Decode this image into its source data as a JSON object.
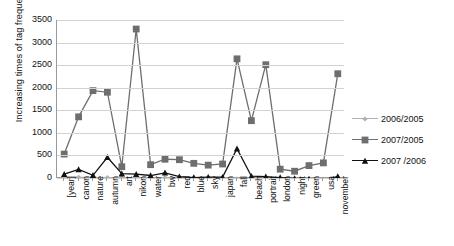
{
  "chart_data": {
    "type": "line",
    "title": "",
    "xlabel": "",
    "ylabel": "Increasing times of tag frequency",
    "ylim": [
      0,
      3500
    ],
    "ytick_labels": [
      "0",
      "500",
      "1000",
      "1500",
      "2000",
      "2500",
      "3000",
      "3500"
    ],
    "yticks": [
      0,
      500,
      1000,
      1500,
      2000,
      2500,
      3000,
      3500
    ],
    "grid": true,
    "legend_position": "right",
    "categories": [
      "[year]",
      "canon",
      "nature",
      "autumn",
      "art",
      "nikon",
      "water",
      "bw",
      "red",
      "blue",
      "sky",
      "japan",
      "fall",
      "beach",
      "portrait",
      "london",
      "night",
      "green",
      "usa",
      "november"
    ],
    "series": [
      {
        "name": "2006/2005",
        "color": "#b0b0b0",
        "marker": "diamond",
        "values": [
          15,
          15,
          15,
          10,
          10,
          10,
          10,
          10,
          10,
          10,
          10,
          10,
          -20,
          -20,
          -20,
          -25,
          -25,
          -25,
          -30,
          -30
        ]
      },
      {
        "name": "2007/2005",
        "color": "#6e6e6e",
        "marker": "square",
        "values": [
          530,
          1355,
          1935,
          1900,
          250,
          3300,
          295,
          415,
          405,
          325,
          285,
          310,
          2640,
          1270,
          2510,
          195,
          150,
          275,
          335,
          2310
        ]
      },
      {
        "name": "2007 /2006",
        "color": "#111111",
        "marker": "triangle",
        "values": [
          85,
          190,
          60,
          460,
          95,
          85,
          55,
          115,
          30,
          10,
          20,
          20,
          650,
          40,
          30,
          10,
          -10,
          -20,
          -60,
          35
        ]
      }
    ]
  },
  "legend": {
    "entries": [
      {
        "label": "2006/2005"
      },
      {
        "label": "2007/2005"
      },
      {
        "label": "2007 /2006"
      }
    ]
  }
}
